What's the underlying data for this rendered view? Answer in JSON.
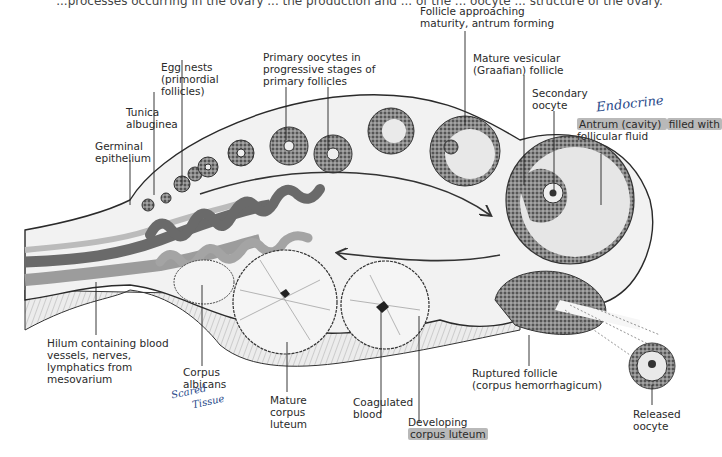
{
  "header": {
    "cut_off_caption": "...processes occurring in the ovary ... the production and ... of the ... oocyte ... structure of the ovary."
  },
  "diagram": {
    "colors": {
      "artery": "#6e6e6e",
      "vein": "#9a9a9a",
      "stroma": "#f1f1f1",
      "follicle_cell": "#5c5c5c",
      "highlight": "#b9b9b9",
      "handwriting": "#2a4a8a"
    },
    "labels": {
      "germinal_epithelium": [
        "Germinal",
        "epithelium"
      ],
      "tunica_albuginea": [
        "Tunica",
        "albuginea"
      ],
      "egg_nests": [
        "Egg nests",
        "(primordial",
        "follicles)"
      ],
      "primary_oocytes": [
        "Primary oocytes in",
        "progressive stages of",
        "primary follicles"
      ],
      "follicle_approaching": [
        "Follicle approaching",
        "maturity, antrum forming"
      ],
      "mature_vesicular": [
        "Mature vesicular",
        "(Graafian) follicle"
      ],
      "secondary_oocyte": [
        "Secondary",
        "oocyte"
      ],
      "antrum_line1_a": "Antrum (cavity) ",
      "antrum_line1_b": "filled with",
      "antrum_line2": "follicular fluid",
      "hilum": [
        "Hilum containing blood",
        "vessels, nerves,",
        "lymphatics from",
        "mesovarium"
      ],
      "corpus_albicans": [
        "Corpus",
        "albicans"
      ],
      "mature_corpus_luteum": [
        "Mature",
        "corpus",
        "luteum"
      ],
      "coagulated_blood": [
        "Coagulated",
        "blood"
      ],
      "developing_line1": "Developing",
      "developing_line2": "corpus luteum",
      "ruptured_follicle": [
        "Ruptured follicle",
        "(corpus hemorrhagicum)"
      ],
      "released_oocyte": [
        "Released",
        "oocyte"
      ]
    },
    "annotations": {
      "handwritten_endocrine": "Endocrine",
      "handwritten_scar_tissue_1": "Scared",
      "handwritten_scar_tissue_2": "Tissue"
    }
  }
}
